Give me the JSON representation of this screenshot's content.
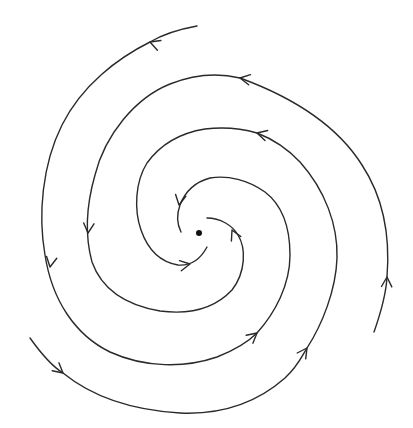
{
  "diagram": {
    "title": "Phase portrait: stable spiral (spiral sink)",
    "type": "phase-portrait",
    "stroke_color": "#2a2a2a",
    "background": "#ffffff",
    "equilibrium": {
      "label": "equilibrium point",
      "x": 199,
      "y": 233,
      "r": 3,
      "color": "#111111"
    },
    "flow_direction": "counterclockwise, spiraling inward toward equilibrium",
    "trajectories": [
      {
        "id": "arm-a",
        "label": "trajectory from top",
        "path": "M197,26 C175,30 160,36 150,42 C118,58 82,85 62,125 C42,165 38,215 45,255 C52,300 75,335 110,352 C145,368 185,368 217,357 C240,348 252,338 257,333 C275,313 290,285 290,255 C290,225 282,205 265,192 C248,180 228,175 210,178 C195,182 185,192 180,205 C176,216 178,226 181,232",
        "arrows": [
          {
            "x": 150,
            "y": 42,
            "angle": 200
          },
          {
            "x": 50,
            "y": 267,
            "angle": 100
          },
          {
            "x": 257,
            "y": 333,
            "angle": -40
          },
          {
            "x": 179,
            "y": 205,
            "angle": 100
          }
        ]
      },
      {
        "id": "arm-b",
        "label": "trajectory from right",
        "path": "M374,332 C380,315 386,295 387,277 C390,240 385,200 362,165 C340,130 300,100 240,78 C215,72 190,76 170,84 C135,98 105,135 95,175 C85,210 86,240 92,262 C102,290 125,305 160,311 C190,315 215,308 232,290 C246,272 246,248 238,235 C232,225 220,218 207,218",
        "arrows": [
          {
            "x": 387,
            "y": 277,
            "angle": -88
          },
          {
            "x": 240,
            "y": 78,
            "angle": 190
          },
          {
            "x": 88,
            "y": 233,
            "angle": 95
          },
          {
            "x": 232,
            "y": 230,
            "angle": -115
          }
        ]
      },
      {
        "id": "arm-c",
        "label": "trajectory from bottom-left",
        "path": "M30,338 C40,352 50,365 63,373 C90,395 130,410 180,413 C225,415 260,400 285,378 C298,366 302,356 307,348 C322,325 336,290 337,258 C338,225 325,190 300,162 C285,146 270,138 257,133 C240,128 222,127 205,129 C180,133 160,145 147,163 C135,182 134,210 141,230 C148,250 160,262 178,265 C190,266 200,260 207,247",
        "arrows": [
          {
            "x": 63,
            "y": 373,
            "angle": 40
          },
          {
            "x": 307,
            "y": 348,
            "angle": -55
          },
          {
            "x": 257,
            "y": 133,
            "angle": 195
          },
          {
            "x": 190,
            "y": 264,
            "angle": -10
          }
        ]
      }
    ]
  }
}
